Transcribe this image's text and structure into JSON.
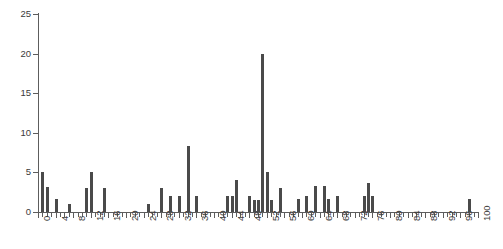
{
  "chart_data": {
    "type": "bar",
    "title": "",
    "subtitle": "",
    "xlabel": "",
    "ylabel": "",
    "xlim": [
      0,
      100
    ],
    "ylim": [
      0,
      25
    ],
    "grid": false,
    "legend": null,
    "bar_color": "#4a4a4a",
    "axis_color": "#5d5d5d",
    "text_color": "#3a3a3a",
    "y_ticks": [
      0,
      5,
      10,
      15,
      20,
      25
    ],
    "x_ticks": [
      0,
      4,
      8,
      12,
      16,
      20,
      24,
      28,
      32,
      36,
      40,
      44,
      48,
      52,
      56,
      60,
      64,
      68,
      72,
      76,
      80,
      84,
      88,
      92,
      96,
      100
    ],
    "x_tick_labels": [
      "0",
      "4",
      "8",
      "12",
      "16",
      "20",
      "24",
      "28",
      "32",
      "36",
      "40",
      "44",
      "48",
      "52",
      "56",
      "60",
      "64",
      "68",
      "72",
      "76",
      "80",
      "84",
      "88",
      "92",
      "96",
      "100"
    ],
    "y_tick_labels": [
      "0",
      "5",
      "10",
      "15",
      "20",
      "25"
    ],
    "x_minor_tick_step": 1,
    "points": [
      {
        "x": 1,
        "y": 5
      },
      {
        "x": 2,
        "y": 3.2
      },
      {
        "x": 4,
        "y": 1.7
      },
      {
        "x": 7,
        "y": 1
      },
      {
        "x": 11,
        "y": 3
      },
      {
        "x": 12,
        "y": 5
      },
      {
        "x": 15,
        "y": 3
      },
      {
        "x": 25,
        "y": 1
      },
      {
        "x": 28,
        "y": 3
      },
      {
        "x": 30,
        "y": 2
      },
      {
        "x": 32,
        "y": 2
      },
      {
        "x": 34,
        "y": 8.3
      },
      {
        "x": 36,
        "y": 2
      },
      {
        "x": 43,
        "y": 2
      },
      {
        "x": 44,
        "y": 2
      },
      {
        "x": 45,
        "y": 4.1
      },
      {
        "x": 48,
        "y": 2
      },
      {
        "x": 49,
        "y": 1.5
      },
      {
        "x": 50,
        "y": 1.5
      },
      {
        "x": 51,
        "y": 20
      },
      {
        "x": 52,
        "y": 5.1
      },
      {
        "x": 53,
        "y": 1.5
      },
      {
        "x": 55,
        "y": 3
      },
      {
        "x": 59,
        "y": 1.7
      },
      {
        "x": 61,
        "y": 2
      },
      {
        "x": 63,
        "y": 3.3
      },
      {
        "x": 65,
        "y": 3.3
      },
      {
        "x": 66,
        "y": 1.7
      },
      {
        "x": 68,
        "y": 2
      },
      {
        "x": 74,
        "y": 2
      },
      {
        "x": 75,
        "y": 3.7
      },
      {
        "x": 76,
        "y": 2
      },
      {
        "x": 98,
        "y": 1.6
      }
    ]
  }
}
